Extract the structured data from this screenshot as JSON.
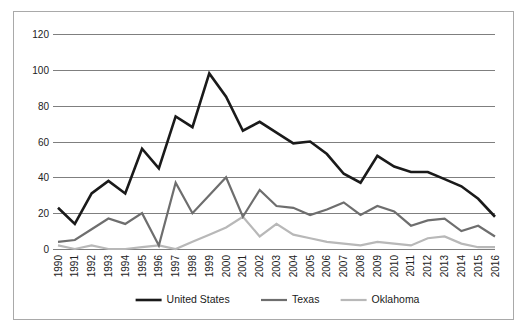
{
  "chart_data": {
    "type": "line",
    "title": "",
    "subtitle": "",
    "xlabel": "",
    "ylabel": "",
    "grid": true,
    "legend_position": "bottom",
    "ylim": [
      0,
      120
    ],
    "yticks": [
      0,
      20,
      40,
      60,
      80,
      100,
      120
    ],
    "ytick_labels": [
      "0",
      "20",
      "40",
      "60",
      "80",
      "100",
      "120"
    ],
    "x": [
      1990,
      1991,
      1992,
      1993,
      1994,
      1995,
      1996,
      1997,
      1998,
      1999,
      2000,
      2001,
      2002,
      2003,
      2004,
      2005,
      2006,
      2007,
      2008,
      2009,
      2010,
      2011,
      2012,
      2013,
      2014,
      2015,
      2016
    ],
    "xtick_labels": [
      "1990",
      "1991",
      "1992",
      "1993",
      "1994",
      "1995",
      "1996",
      "1997",
      "1998",
      "1999",
      "2000",
      "2001",
      "2002",
      "2003",
      "2004",
      "2005",
      "2006",
      "2007",
      "2008",
      "2009",
      "2010",
      "2011",
      "2012",
      "2013",
      "2014",
      "2015",
      "2016"
    ],
    "series": [
      {
        "name": "United States",
        "color": "#1a1a1a",
        "width": 2.6,
        "values": [
          23,
          14,
          31,
          38,
          31,
          56,
          45,
          74,
          68,
          98,
          85,
          66,
          71,
          65,
          59,
          60,
          53,
          42,
          37,
          52,
          46,
          43,
          43,
          39,
          35,
          28,
          18
        ]
      },
      {
        "name": "Texas",
        "color": "#6e6e6e",
        "width": 2.2,
        "values": [
          4,
          5,
          11,
          17,
          14,
          20,
          2,
          37,
          20,
          30,
          40,
          18,
          33,
          24,
          23,
          19,
          22,
          26,
          19,
          24,
          21,
          13,
          16,
          17,
          10,
          13,
          7
        ]
      },
      {
        "name": "Oklahoma",
        "color": "#b8b8b8",
        "width": 2.2,
        "values": [
          2,
          0,
          2,
          0,
          0,
          1,
          2,
          0,
          4,
          8,
          12,
          18,
          7,
          14,
          8,
          6,
          4,
          3,
          2,
          4,
          3,
          2,
          6,
          7,
          3,
          1,
          1
        ]
      }
    ]
  },
  "legend": {
    "items": [
      {
        "label": "United States",
        "color": "#1a1a1a"
      },
      {
        "label": "Texas",
        "color": "#6e6e6e"
      },
      {
        "label": "Oklahoma",
        "color": "#b8b8b8"
      }
    ]
  }
}
